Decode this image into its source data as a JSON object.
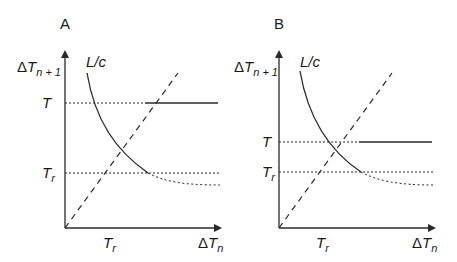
{
  "panels": [
    {
      "id": "A",
      "label": "A",
      "y_axis_label": {
        "delta": "Δ",
        "var": "T",
        "sub": "n + 1"
      },
      "x_axis_label": {
        "delta": "Δ",
        "var": "T",
        "sub": "n"
      },
      "curve_label": "L/c",
      "y_ticks": [
        {
          "var": "T",
          "sub": ""
        },
        {
          "var": "T",
          "sub": "r"
        }
      ],
      "x_ticks": [
        {
          "var": "T",
          "sub": "r"
        }
      ]
    },
    {
      "id": "B",
      "label": "B",
      "y_axis_label": {
        "delta": "Δ",
        "var": "T",
        "sub": "n + 1"
      },
      "x_axis_label": {
        "delta": "Δ",
        "var": "T",
        "sub": "n"
      },
      "curve_label": "L/c",
      "y_ticks": [
        {
          "var": "T",
          "sub": ""
        },
        {
          "var": "T",
          "sub": "r"
        }
      ],
      "x_ticks": [
        {
          "var": "T",
          "sub": "r"
        }
      ]
    }
  ],
  "colors": {
    "line": "#2a2a2a",
    "text": "#1a1a1a",
    "background": "#ffffff"
  }
}
